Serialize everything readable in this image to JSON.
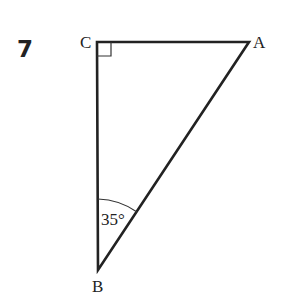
{
  "question_number": "7",
  "figure": {
    "vertices": {
      "A": {
        "label": "A",
        "x": 249,
        "y": 42
      },
      "B": {
        "label": "B",
        "x": 98,
        "y": 270
      },
      "C": {
        "label": "C",
        "x": 97,
        "y": 42
      }
    },
    "right_angle_at": "C",
    "angle_B_label": "35°"
  }
}
